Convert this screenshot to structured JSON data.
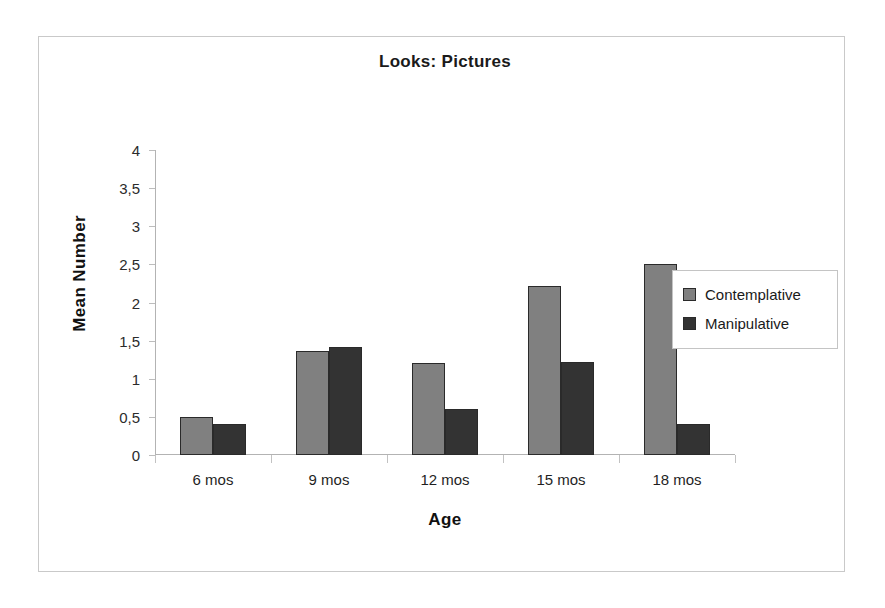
{
  "chart_data": {
    "type": "bar",
    "title": "Looks: Pictures",
    "xlabel": "Age",
    "ylabel": "Mean Number",
    "categories": [
      "6 mos",
      "9 mos",
      "12 mos",
      "15 mos",
      "18 mos"
    ],
    "series": [
      {
        "name": "Contemplative",
        "color": "#808080",
        "values": [
          0.5,
          1.37,
          1.2,
          2.22,
          2.5
        ]
      },
      {
        "name": "Manipulative",
        "color": "#333333",
        "values": [
          0.4,
          1.42,
          0.6,
          1.22,
          0.4
        ]
      }
    ],
    "ylim": [
      0,
      4
    ],
    "ytick_values": [
      0,
      0.5,
      1,
      1.5,
      2,
      2.5,
      3,
      3.5,
      4
    ],
    "ytick_labels": [
      "0",
      "0,5",
      "1",
      "1,5",
      "2",
      "2,5",
      "3",
      "3,5",
      "4"
    ],
    "grid": false,
    "legend_position": "right",
    "decimal_separator": ","
  }
}
